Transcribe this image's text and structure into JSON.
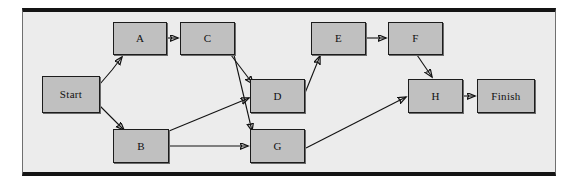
{
  "diagram": {
    "type": "directed-graph",
    "panel": {
      "background_color": "#ececec",
      "border_color": "#141414"
    },
    "node_style": {
      "fill_color": "#c0c0c0",
      "border_color": "#1c1c1c",
      "text_color": "#101010"
    },
    "edge_style": {
      "line_color": "#121212",
      "arrowhead": "filled-triangle"
    },
    "nodes": [
      {
        "id": "start",
        "label": "Start",
        "x": 42,
        "y": 76,
        "w": 58,
        "h": 37
      },
      {
        "id": "a",
        "label": "A",
        "x": 113,
        "y": 22,
        "w": 54,
        "h": 33
      },
      {
        "id": "c",
        "label": "C",
        "x": 180,
        "y": 22,
        "w": 55,
        "h": 33
      },
      {
        "id": "b",
        "label": "B",
        "x": 113,
        "y": 129,
        "w": 56,
        "h": 34
      },
      {
        "id": "d",
        "label": "D",
        "x": 250,
        "y": 79,
        "w": 55,
        "h": 34
      },
      {
        "id": "g",
        "label": "G",
        "x": 250,
        "y": 129,
        "w": 55,
        "h": 34
      },
      {
        "id": "e",
        "label": "E",
        "x": 311,
        "y": 22,
        "w": 55,
        "h": 33
      },
      {
        "id": "f",
        "label": "F",
        "x": 388,
        "y": 22,
        "w": 55,
        "h": 33
      },
      {
        "id": "h",
        "label": "H",
        "x": 408,
        "y": 79,
        "w": 55,
        "h": 34
      },
      {
        "id": "finish",
        "label": "Finish",
        "x": 477,
        "y": 79,
        "w": 58,
        "h": 34
      }
    ],
    "edges": [
      {
        "id": "start-a",
        "from": "Start",
        "to": "A",
        "path": "M 100 84 L 112 70 L 122 57"
      },
      {
        "id": "start-b",
        "from": "Start",
        "to": "B",
        "path": "M 100 106 L 112 118 L 124 130"
      },
      {
        "id": "a-c",
        "from": "A",
        "to": "C",
        "path": "M 167 38 L 178 38"
      },
      {
        "id": "c-d",
        "from": "C",
        "to": "D",
        "path": "M 231 55 L 253 84"
      },
      {
        "id": "c-g",
        "from": "C",
        "to": "G",
        "path": "M 234 55 L 252 131"
      },
      {
        "id": "b-d",
        "from": "B",
        "to": "D",
        "path": "M 169 131 L 249 98"
      },
      {
        "id": "b-g",
        "from": "B",
        "to": "G",
        "path": "M 169 146 L 248 146"
      },
      {
        "id": "d-e",
        "from": "D",
        "to": "E",
        "path": "M 305 93 L 320 56"
      },
      {
        "id": "e-f",
        "from": "E",
        "to": "F",
        "path": "M 366 38 L 386 38"
      },
      {
        "id": "f-h",
        "from": "F",
        "to": "H",
        "path": "M 417 55 L 432 77"
      },
      {
        "id": "g-h",
        "from": "G",
        "to": "H",
        "path": "M 306 148 L 406 97"
      },
      {
        "id": "h-finish",
        "from": "H",
        "to": "Finish",
        "path": "M 463 96 L 475 96"
      }
    ]
  }
}
